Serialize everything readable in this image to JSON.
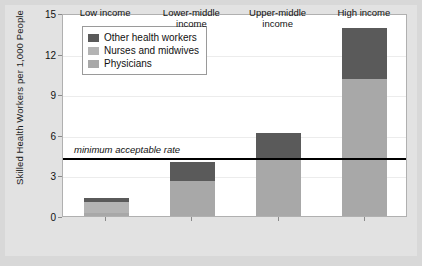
{
  "chart_data": {
    "type": "bar",
    "stacked": true,
    "title": "",
    "xlabel": "",
    "ylabel": "Skilled Health Workers per 1,000 People",
    "categories": [
      "Low income",
      "Lower-middle\nincome",
      "Upper-middle\nincome",
      "High income"
    ],
    "category_labels": [
      {
        "line1": "Low income",
        "line2": ""
      },
      {
        "line1": "Lower-middle",
        "line2": "income"
      },
      {
        "line1": "Upper-middle",
        "line2": "income"
      },
      {
        "line1": "High income",
        "line2": ""
      }
    ],
    "series": [
      {
        "name": "Physicians",
        "color": "#a8a8a8",
        "values": [
          0.25,
          2.6,
          4.3,
          10.1
        ]
      },
      {
        "name": "Nurses and midwives",
        "color": "#b4b4b4",
        "values": [
          0.75,
          0.0,
          0.0,
          0.0
        ]
      },
      {
        "name": "Other health workers",
        "color": "#5a5a5a",
        "values": [
          0.35,
          1.4,
          1.8,
          3.8
        ]
      }
    ],
    "totals": [
      1.35,
      4.0,
      6.1,
      13.9
    ],
    "ylim": [
      0,
      15
    ],
    "yticks": [
      0,
      3,
      6,
      9,
      12,
      15
    ],
    "ytick_labels": [
      "0",
      "3",
      "6",
      "9",
      "12",
      "15"
    ],
    "grid": true,
    "legend_position": "upper-left",
    "annotations": [
      {
        "name": "minimum-acceptable-rate",
        "text": "minimum acceptable rate",
        "value": 4.45,
        "style": "italic",
        "line_color": "#000000"
      }
    ]
  },
  "legend": {
    "items": [
      {
        "label": "Other health workers",
        "color": "#5a5a5a"
      },
      {
        "label": "Nurses and midwives",
        "color": "#b4b4b4"
      },
      {
        "label": "Physicians",
        "color": "#a8a8a8"
      }
    ]
  },
  "colors": {
    "figure_background": "#d8d8d8",
    "plot_background": "#ffffff",
    "plot_border": "#b0b0b0",
    "gridline": "#ececec",
    "axis": "#8a8a8a",
    "text": "#111111"
  }
}
